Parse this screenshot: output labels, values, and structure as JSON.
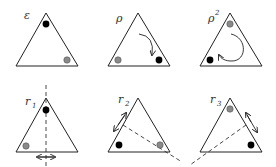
{
  "diagram": {
    "colors": {
      "black_dot": "#000000",
      "gray_dot": "#8a8a8a",
      "line": "#222222"
    },
    "panels": [
      {
        "id": "e",
        "label": "ε",
        "sub": "",
        "annotation": "identity",
        "black_dot": "top",
        "gray_dot": "bottom-right"
      },
      {
        "id": "rho",
        "label": "ρ",
        "sub": "",
        "annotation": "clockwise-rotation-arrow",
        "black_dot": "bottom-right",
        "gray_dot": "bottom-left"
      },
      {
        "id": "rho2",
        "label": "ρ",
        "sup": "2",
        "annotation": "large-rotation-arrow",
        "black_dot": "bottom-left",
        "gray_dot": "top"
      },
      {
        "id": "r1",
        "label": "r",
        "sub": "1",
        "annotation": "vertical-reflection-axis",
        "black_dot": "top",
        "gray_dot": "bottom-left"
      },
      {
        "id": "r2",
        "label": "r",
        "sub": "2",
        "annotation": "reflection-axis-through-bottom-right",
        "black_dot": "bottom-left",
        "gray_dot": "bottom-right"
      },
      {
        "id": "r3",
        "label": "r",
        "sub": "3",
        "annotation": "reflection-axis-through-bottom-left",
        "black_dot": "bottom-right",
        "gray_dot": "top"
      }
    ]
  }
}
